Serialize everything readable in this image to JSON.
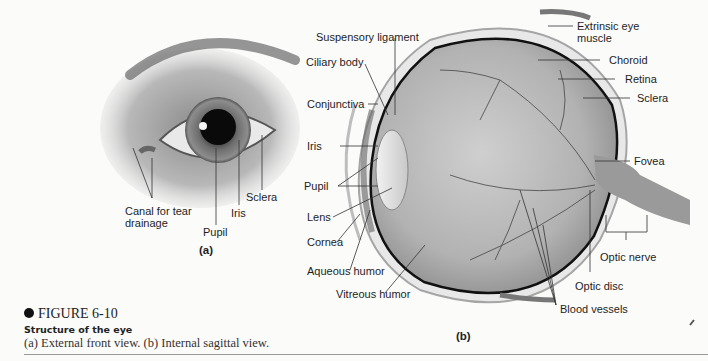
{
  "figure": {
    "number": "FIGURE 6-10",
    "title": "Structure of the eye",
    "description": "(a) External front view. (b) Internal sagittal view."
  },
  "panel_a": {
    "caption": "(a)",
    "labels": {
      "canal": "Canal for tear",
      "canal2": "drainage",
      "pupil": "Pupil",
      "iris": "Iris",
      "sclera": "Sclera"
    }
  },
  "panel_b": {
    "caption": "(b)",
    "labels": {
      "suspensory": "Suspensory ligament",
      "ciliary": "Ciliary body",
      "conjunctiva": "Conjunctiva",
      "iris": "Iris",
      "pupil": "Pupil",
      "lens": "Lens",
      "cornea": "Cornea",
      "aqueous": "Aqueous humor",
      "vitreous": "Vitreous humor",
      "extrinsic": "Extrinsic eye",
      "extrinsic2": "muscle",
      "choroid": "Choroid",
      "retina": "Retina",
      "sclera": "Sclera",
      "fovea": "Fovea",
      "optic_nerve": "Optic nerve",
      "optic_disc": "Optic disc",
      "blood_vessels": "Blood vessels"
    }
  }
}
